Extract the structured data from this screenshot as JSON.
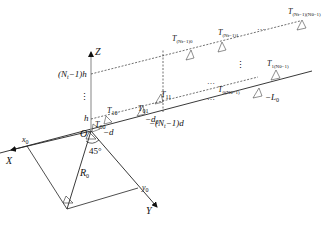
{
  "diagram": {
    "type": "3D geometry of MIMO SAR / radar array with target",
    "axes": {
      "x_label": "X",
      "y_label": "Y",
      "z_label": "Z",
      "origin_label": "O"
    },
    "angle_label": "45°",
    "range_label": "R",
    "range_sub": "0",
    "target_coords": {
      "x0": "x",
      "x0_sub": "0",
      "y0": "y",
      "y0_sub": "0"
    },
    "z_ticks": [
      {
        "text": "h",
        "id": "h"
      },
      {
        "text": "(N",
        "sub": "t",
        "tail": "−1)h",
        "id": "nt-1-h"
      }
    ],
    "ground_ticks": [
      {
        "text": "−d"
      },
      {
        "text": "−d",
        "sub": "0"
      },
      {
        "text": "−(N",
        "sub": "t",
        "tail": "−1)d"
      },
      {
        "text": "−L",
        "sub": "0"
      }
    ],
    "elements": [
      {
        "main": "T",
        "sub": "00"
      },
      {
        "main": "T",
        "sub": "10"
      },
      {
        "main": "T",
        "sub": "01"
      },
      {
        "main": "T",
        "sub": "11"
      },
      {
        "main": "T",
        "sub": "0(Nθ−1)"
      },
      {
        "main": "T",
        "sub": "1(Nθ−1)"
      },
      {
        "main": "T",
        "sub": "(Nt−1)0"
      },
      {
        "main": "T",
        "sub": "(Nt−1)1"
      },
      {
        "main": "T",
        "sub": "(Nt−1)(Nθ−1)"
      }
    ],
    "ellipsis": "…",
    "vertical_ellipsis": "⋮"
  }
}
